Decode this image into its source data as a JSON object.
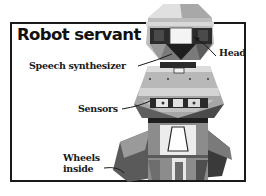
{
  "diagram": {
    "title": "Robot servant",
    "labels": {
      "head": "Head",
      "speech_synthesizer": "Speech synthesizer",
      "sensors": "Sensors",
      "wheels_line1": "Wheels",
      "wheels_line2": "inside"
    },
    "colors": {
      "frame": "#1a1a1a",
      "text": "#111111",
      "robot_light": "#d9d9d9",
      "robot_mid": "#8c8c8c",
      "robot_dark": "#3a3a3a",
      "background": "#ffffff"
    }
  }
}
